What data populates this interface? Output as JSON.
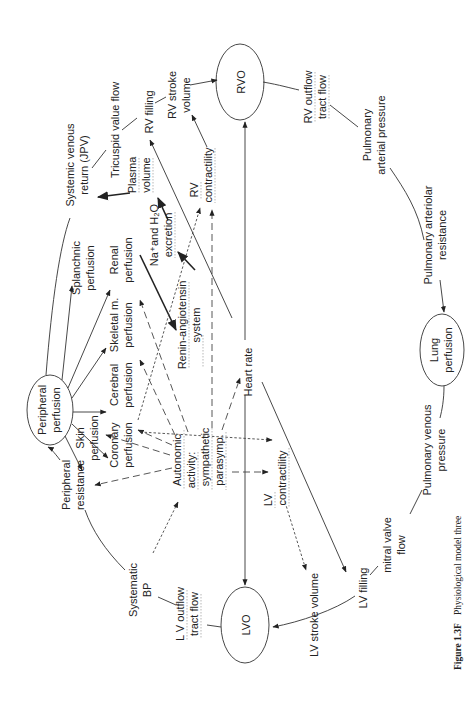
{
  "figure": {
    "caption_label": "Figure 1.3F",
    "caption_text": "Physiological model three",
    "orientation": "rotated 90° counter-clockwise"
  },
  "nodes": {
    "peripheral_perfusion": [
      "Peripheral",
      "perfusion"
    ],
    "rvo": "RVO",
    "lvo": "LVO",
    "lung_perfusion": [
      "Lung",
      "perfusion"
    ]
  },
  "labels": {
    "systemic_venous_return": [
      "Systemic venous",
      "return (JPV)"
    ],
    "tricuspid_flow": "Tricuspid value flow",
    "rv_filling": "RV filling",
    "rv_stroke_volume": [
      "RV stroke",
      "volume"
    ],
    "rv_outflow": [
      "RV outflow",
      "tract flow"
    ],
    "pulmonary_arterial_pressure": [
      "Pulmonary",
      "arterial pressure"
    ],
    "pulmonary_arteriolar_resistance": [
      "Pulmonary arteriolar",
      "resistance"
    ],
    "pulmonary_venous_pressure": [
      "Pulmonary venous",
      "pressure"
    ],
    "mitral_valve_flow": [
      "mitral valve",
      "flow"
    ],
    "lv_filling": "LV filling",
    "lv_stroke_volume": "LV stroke volume",
    "lv_outflow": [
      "L V outflow",
      "tract flow"
    ],
    "systematic_bp": [
      "Systematic",
      "BP"
    ],
    "peripheral_resistance": [
      "Peripheral",
      "resistance"
    ],
    "splanchnic_perfusion": [
      "Splanchnic",
      "perfusion"
    ],
    "renal_perfusion": [
      "Renal",
      "perfusion"
    ],
    "skeletal_perfusion": [
      "Skeletal m.",
      "perfusion"
    ],
    "cerebral_perfusion": [
      "Cerebral",
      "perfusion"
    ],
    "coronary_perfusion": [
      "Coronary",
      "perfusion"
    ],
    "skin_perfusion": [
      "Skin",
      "perfusion"
    ],
    "plasma_volume": [
      "Plasma",
      "volume"
    ],
    "na_h2o_excretion": [
      "Na⁺and H₂O",
      "excretion"
    ],
    "renin_angiotensin": [
      "Renin-angiotensin",
      "system"
    ],
    "rv_contractility": [
      "RV",
      "contractility"
    ],
    "lv_contractility": [
      "LV",
      "contractility"
    ],
    "autonomic_activity": [
      "Autonomic",
      "activity:",
      "sympathetic",
      "parasymp."
    ],
    "heart_rate": "Heart rate"
  },
  "legend_line_styles": {
    "solid": "direct relation",
    "dashed": "autonomic influence",
    "dotted": "contractility influence",
    "thick": "renal-volume pathway"
  }
}
